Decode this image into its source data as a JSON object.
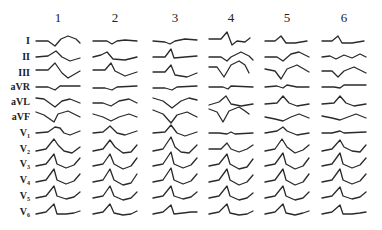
{
  "figure": {
    "type": "ecg-lead-grid",
    "stroke_color": "#2a2a2a",
    "columns": [
      {
        "label": "1",
        "x": 58
      },
      {
        "label": "2",
        "x": 115
      },
      {
        "label": "3",
        "x": 175
      },
      {
        "label": "4",
        "x": 231
      },
      {
        "label": "5",
        "x": 287
      },
      {
        "label": "6",
        "x": 344
      }
    ],
    "column_label_y": 22,
    "leads": [
      {
        "label": "I",
        "base": "I",
        "sub": "",
        "y": 41
      },
      {
        "label": "II",
        "base": "II",
        "sub": "",
        "y": 57
      },
      {
        "label": "III",
        "base": "III",
        "sub": "",
        "y": 73
      },
      {
        "label": "aVR",
        "base": "aVR",
        "sub": "",
        "y": 87
      },
      {
        "label": "aVL",
        "base": "aVL",
        "sub": "",
        "y": 102
      },
      {
        "label": "aVF",
        "base": "aVF",
        "sub": "",
        "y": 117
      },
      {
        "label": "V1",
        "base": "V",
        "sub": "1",
        "y": 133
      },
      {
        "label": "V2",
        "base": "V",
        "sub": "2",
        "y": 149
      },
      {
        "label": "V3",
        "base": "V",
        "sub": "3",
        "y": 164
      },
      {
        "label": "V4",
        "base": "V",
        "sub": "4",
        "y": 180
      },
      {
        "label": "V5",
        "base": "V",
        "sub": "5",
        "y": 196
      },
      {
        "label": "V6",
        "base": "V",
        "sub": "6",
        "y": 212
      }
    ],
    "traces": [
      [
        "M-22,0 L-10,0 L-3,5 L3,-2 L10,-5 L18,-2 L22,2",
        "M-22,0 L-8,0 L-3,3 L2,0 L10,-1 L22,0",
        "M-22,0 L-10,1 L-5,3 L0,0 L10,-2 L22,-1",
        "M-22,-2 L-10,-2 L-4,-9 L1,4 L6,0 L14,1 L19,-3",
        "M-22,0 L-12,0 L-6,-5 L-1,2 L8,2 L20,0",
        "M-22,0 L-12,0 L-6,-5 L-2,2 L8,2 L20,0"
      ],
      [
        "M-22,0 L-10,-1 L-2,-6 L4,0 L12,4 L22,1",
        "M-22,0 L-14,-2 L-8,-5 L-2,2 L10,3 L22,0",
        "M-22,0 L-10,0 L-4,-8 L-1,1 L10,0 L22,-1",
        "M-22,0 L-10,0 L-4,4 L0,0 L10,-5 L18,-1 L22,3",
        "M-22,0 L-10,0 L-4,4 L4,-3 L12,-5 L22,0",
        "M-22,0 L-14,-1 L-8,2 L0,-2 L8,1 L16,-3 L22,0"
      ],
      [
        "M-22,-3 L-10,-3 L-3,-10 L4,0 L10,5 L22,-2",
        "M-22,-3 L-10,-3 L-4,-10 L0,-2 L10,3 L22,-1",
        "M-22,-1 L-10,-1 L-4,-8 L0,2 L12,4 L22,0",
        "M-22,-6 L-14,-6 L-7,4 L0,-8 L8,-12 L14,-8 L18,0",
        "M-22,-4 L-12,-2 L-6,6 L0,-4 L10,-8 L22,-1",
        "M-22,-2 L-12,-2 L-6,4 L0,-2 L10,-6 L22,0"
      ],
      [
        "M-22,0 L-10,0 L-3,3 L2,-1 L22,-1",
        "M-22,1 L-10,1 L-3,3 L2,0 L22,-1",
        "M-22,1 L-10,1 L-3,3 L2,0 L22,-1",
        "M-22,0 L-8,0 L-3,2 L0,-1 L22,0",
        "M-22,0 L-10,-1 L-4,1 L0,-2 L10,0 L22,0",
        "M-22,0 L-10,0 L-4,1 L0,-2 L22,-2"
      ],
      [
        "M-22,-4 L-14,-3 L-3,5 L4,-1 L12,-3 L22,1",
        "M-22,1 L-12,1 L-4,4 L4,-1 L14,-3 L22,1",
        "M-22,-4 L-12,-1 L-3,6 L6,-1 L14,-4 L22,-2",
        "M-22,3 L-12,0 L-5,-6 L0,2 L10,4 L22,2",
        "M-22,2 L-10,1 L-4,-6 L2,1 L10,4 L22,2",
        "M-22,2 L-10,1 L-4,-6 L2,1 L10,4 L22,2"
      ],
      [
        "M-22,-5 L-14,-2 L-4,5 L0,-3 L10,-6 L22,0",
        "M-22,-3 L-12,0 L-4,4 L4,0 L14,-3 L22,0",
        "M-22,-7 L-12,-3 L-4,6 L2,-2 L12,-5 L22,0",
        "M-22,-8 L-14,-5 L-8,5 L-2,-6 L8,-10 L14,-6 L18,-3",
        "M-22,0 L-12,2 L-4,4 L4,0 L12,-3 L22,1",
        "M-22,-1 L-12,1 L-4,3 L4,0 L12,-3 L22,1"
      ],
      [
        "M-22,0 L-10,-1 L-3,-6 L2,-5 L6,0 L12,2 L22,-2",
        "M-22,0 L-12,-1 L-5,-7 L2,0 L10,2 L22,-2",
        "M-22,0 L-10,-1 L-4,-8 L2,0 L10,3 L22,-1",
        "M-22,0 L-12,0 L-4,1 L0,-1 L4,1 L22,0",
        "M-22,0 L-10,-2 L-4,-6 L0,-2 L10,2 L22,0",
        "M-22,0 L-12,0 L-4,-2 L0,0 L22,-1"
      ],
      [
        "M-22,2 L-12,0 L-4,-10 L0,-4 L6,2 L14,4 L22,-2",
        "M-22,2 L-12,0 L-5,-9 L0,-2 L8,4 L16,3 L22,-4",
        "M-22,2 L-12,0 L-4,-12 L0,-2 L6,3 L14,4 L22,-4",
        "M-22,0 L-10,0 L-4,-6 L0,0 L8,3 L16,0 L22,-4",
        "M-22,2 L-12,0 L-5,-10 L0,-2 L8,4 L16,1 L22,-4",
        "M-22,2 L-12,0 L-4,-9 L0,-2 L8,2 L16,3 L22,-4"
      ],
      [
        "M-22,2 L-12,0 L-4,-10 L-1,0 L8,4 L16,1 L22,-6",
        "M-22,2 L-12,0 L-5,-10 L-1,0 L8,5 L16,2 L22,-6",
        "M-22,2 L-12,0 L-4,-12 L-1,0 L8,4 L16,1 L22,-6",
        "M-22,2 L-12,0 L-4,-10 L-1,0 L8,5 L16,3 L22,-5",
        "M-22,2 L-12,0 L-4,-11 L-1,0 L8,5 L16,2 L22,-6",
        "M-22,2 L-12,0 L-4,-11 L-1,0 L8,4 L16,1 L22,-6"
      ],
      [
        "M-22,2 L-12,0 L-4,-11 L-1,0 L8,4 L16,1 L22,-6",
        "M-22,2 L-12,0 L-5,-11 L-1,0 L8,5 L16,3 L22,-6",
        "M-22,2 L-12,0 L-4,-12 L-1,0 L8,4 L16,1 L22,-6",
        "M-22,2 L-12,0 L-4,-11 L-1,0 L8,5 L16,2 L22,-5",
        "M-22,2 L-12,0 L-4,-11 L-1,0 L8,5 L16,2 L22,-6",
        "M-22,2 L-12,0 L-4,-11 L-1,0 L8,4 L16,1 L22,-6"
      ],
      [
        "M-22,2 L-12,0 L-4,-10 L-1,0 L8,3 L16,1 L22,-4",
        "M-22,2 L-12,0 L-5,-10 L-1,0 L8,4 L16,2 L22,-4",
        "M-22,2 L-12,0 L-4,-10 L-1,0 L8,3 L16,1 L22,-4",
        "M-22,2 L-12,0 L-4,-10 L-1,0 L8,4 L16,2 L22,-3",
        "M-22,2 L-12,0 L-4,-10 L-1,0 L8,4 L16,2 L22,-4",
        "M-22,2 L-12,0 L-4,-9 L-1,0 L8,3 L16,1 L22,-4"
      ],
      [
        "M-22,2 L-12,0 L-4,-8 L-1,2 L8,2 L16,1 L22,-1",
        "M-22,2 L-12,0 L-5,-8 L-1,1 L8,3 L16,2 L22,-1",
        "M-22,2 L-12,0 L-4,-7 L-1,2 L8,1 L16,0 L22,0",
        "M-22,2 L-12,0 L-4,-8 L-1,1 L8,3 L16,2 L22,-1",
        "M-22,2 L-12,0 L-4,-8 L-1,1 L8,3 L16,1 L22,-1",
        "M-22,2 L-12,0 L-4,-7 L-1,2 L8,2 L16,1 L22,0"
      ],
      [
        "M-22,0 L-10,0 L-4,-4 L0,2 L8,0 L22,0",
        "M-22,0 L-10,0 L-4,-3 L0,1 L8,1 L22,0",
        "M-22,0 L-10,0 L-4,-3 L-1,4 L4,0 L22,0",
        "M-22,0 L-10,0 L-4,-4 L0,2 L8,1 L22,0",
        "M-22,0 L-10,0 L-4,-5 L0,1 L8,0 L22,0",
        "M-22,0 L-10,0 L-4,-5 L0,2 L8,0 L22,0"
      ]
    ]
  }
}
